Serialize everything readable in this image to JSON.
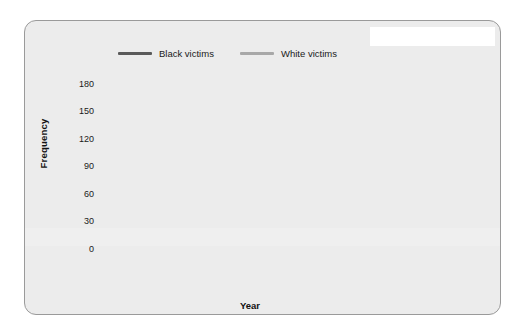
{
  "figure": {
    "background": "#ececec",
    "border_color": "#9a9a9a"
  },
  "legend": {
    "position": "top",
    "items": [
      {
        "label": "Black victims",
        "color": "#5a5a5a"
      },
      {
        "label": "White victims",
        "color": "#a8a8a8"
      }
    ]
  },
  "axes": {
    "ylabel": "Frequency",
    "xlabel": "Year",
    "yticks": [
      0,
      30,
      60,
      90,
      120,
      150,
      180
    ],
    "xticks": [
      1882,
      1887,
      1892,
      1897,
      1902,
      1907,
      1912,
      1917,
      1922,
      1927,
      1932
    ],
    "ylim": [
      0,
      180
    ],
    "xlim": [
      1882,
      1935
    ],
    "grid": "horizontal-dotted"
  },
  "table": {
    "title": "Top Lynching States,\n1882–1964,\nBlack Victims Only",
    "title_lines": [
      "Top Lynching States,",
      "1882–1964,",
      "Black Victims Only"
    ],
    "columns": [
      "State",
      "% of total"
    ],
    "rows": [
      {
        "state": "Mississippi",
        "pct": "12"
      },
      {
        "state": "Georgia",
        "pct": "11"
      },
      {
        "state": "Texas",
        "pct": "10"
      },
      {
        "state": "Louisiana",
        "pct": "8"
      },
      {
        "state": "Alabama",
        "pct": "7"
      },
      {
        "state": "Arkansas",
        "pct": "6"
      },
      {
        "state": "Florida",
        "pct": "6"
      },
      {
        "state": "Tennessee",
        "pct": "5"
      },
      {
        "state": "Other",
        "pct": "35"
      },
      {
        "state": "Total",
        "pct": "100"
      }
    ]
  },
  "chart_data": {
    "type": "line",
    "title": "",
    "xlabel": "Year",
    "ylabel": "Frequency",
    "xlim": [
      1882,
      1935
    ],
    "ylim": [
      0,
      180
    ],
    "yticks": [
      0,
      30,
      60,
      90,
      120,
      150,
      180
    ],
    "grid": true,
    "legend_position": "top",
    "x": [
      1882,
      1883,
      1884,
      1885,
      1886,
      1887,
      1888,
      1889,
      1890,
      1891,
      1892,
      1893,
      1894,
      1895,
      1896,
      1897,
      1898,
      1899,
      1900,
      1901,
      1902,
      1903,
      1904,
      1905,
      1906,
      1907,
      1908,
      1909,
      1910,
      1911,
      1912,
      1913,
      1914,
      1915,
      1916,
      1917,
      1918,
      1919,
      1920,
      1921,
      1922,
      1923,
      1924,
      1925,
      1926,
      1927,
      1928,
      1929,
      1930,
      1931,
      1932,
      1933,
      1934,
      1935
    ],
    "series": [
      {
        "name": "Black victims",
        "color": "#5a5a5a",
        "values": [
          50,
          52,
          51,
          74,
          74,
          70,
          69,
          94,
          85,
          113,
          158,
          118,
          134,
          113,
          78,
          123,
          102,
          84,
          107,
          107,
          86,
          84,
          76,
          57,
          62,
          58,
          89,
          69,
          67,
          60,
          62,
          52,
          51,
          56,
          50,
          38,
          64,
          83,
          61,
          59,
          51,
          29,
          16,
          17,
          23,
          16,
          10,
          7,
          20,
          12,
          6,
          24,
          15,
          18
        ]
      },
      {
        "name": "White victims",
        "color": "#a8a8a8",
        "values": [
          64,
          77,
          160,
          78,
          64,
          50,
          68,
          76,
          11,
          71,
          69,
          34,
          58,
          66,
          45,
          35,
          19,
          21,
          25,
          28,
          6,
          2,
          5,
          5,
          4,
          3,
          8,
          13,
          9,
          7,
          2,
          1,
          4,
          13,
          4,
          2,
          4,
          7,
          8,
          6,
          6,
          4,
          0,
          1,
          7,
          0,
          1,
          3,
          1,
          1,
          2,
          4,
          0,
          2
        ]
      }
    ]
  }
}
